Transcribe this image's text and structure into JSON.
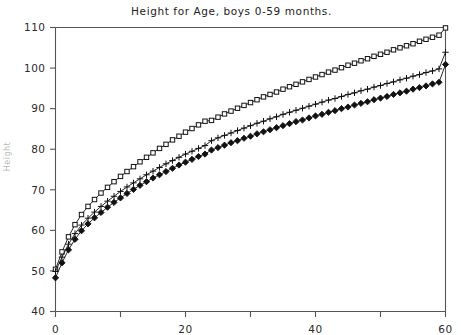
{
  "chart_title": "Height for Age, boys 0-59 months.",
  "y_axis_label": "Height",
  "axes": {
    "x_tick_labels": [
      "0",
      "20",
      "40",
      "60"
    ],
    "x_minor_ticks": [
      10,
      30,
      50
    ],
    "y_tick_labels": [
      "40",
      "50",
      "60",
      "70",
      "80",
      "90",
      "100",
      "110"
    ]
  },
  "colors": {
    "line": "#111111",
    "frame": "#555555",
    "text": "#232323"
  },
  "chart_data": {
    "type": "line",
    "title": "Height for Age, boys 0-59 months.",
    "xlabel": "",
    "ylabel": "Height",
    "xlim": [
      0,
      60
    ],
    "ylim": [
      40,
      110
    ],
    "grid": false,
    "legend": "none",
    "x": [
      0,
      1,
      2,
      3,
      4,
      5,
      6,
      7,
      8,
      9,
      10,
      11,
      12,
      13,
      14,
      15,
      16,
      17,
      18,
      19,
      20,
      21,
      22,
      23,
      24,
      25,
      26,
      27,
      28,
      29,
      30,
      31,
      32,
      33,
      34,
      35,
      36,
      37,
      38,
      39,
      40,
      41,
      42,
      43,
      44,
      45,
      46,
      47,
      48,
      49,
      50,
      51,
      52,
      53,
      54,
      55,
      56,
      57,
      58,
      59,
      60
    ],
    "series": [
      {
        "name": "upper",
        "marker": "square",
        "values": [
          50.4,
          54.7,
          58.4,
          61.4,
          63.9,
          65.9,
          67.6,
          69.2,
          70.6,
          72.0,
          73.3,
          74.5,
          75.7,
          76.9,
          78.0,
          79.1,
          80.2,
          81.2,
          82.3,
          83.2,
          84.2,
          85.1,
          86.0,
          86.9,
          87.1,
          87.9,
          88.7,
          89.4,
          90.1,
          90.8,
          91.5,
          92.2,
          92.9,
          93.5,
          94.1,
          94.8,
          95.4,
          96.0,
          96.6,
          97.2,
          97.8,
          98.4,
          99.0,
          99.5,
          100.1,
          100.7,
          101.2,
          101.8,
          102.3,
          102.9,
          103.4,
          103.9,
          104.5,
          105.0,
          105.5,
          106.0,
          106.6,
          107.1,
          107.6,
          108.1,
          109.9
        ]
      },
      {
        "name": "median",
        "marker": "plus",
        "values": [
          49.9,
          53.4,
          56.6,
          59.2,
          61.3,
          63.0,
          64.5,
          65.9,
          67.2,
          68.4,
          69.6,
          70.7,
          71.7,
          72.7,
          73.7,
          74.6,
          75.5,
          76.4,
          77.2,
          78.0,
          78.8,
          79.5,
          80.2,
          80.9,
          82.1,
          82.8,
          83.4,
          84.0,
          84.6,
          85.2,
          85.8,
          86.4,
          86.9,
          87.5,
          88.0,
          88.6,
          89.1,
          89.6,
          90.1,
          90.6,
          91.1,
          91.6,
          92.1,
          92.5,
          93.0,
          93.5,
          93.9,
          94.4,
          94.8,
          95.3,
          95.7,
          96.2,
          96.6,
          97.1,
          97.5,
          98.0,
          98.4,
          98.9,
          99.3,
          99.8,
          103.9
        ]
      },
      {
        "name": "lower",
        "marker": "diamond",
        "values": [
          48.3,
          52.0,
          55.2,
          57.8,
          59.9,
          61.6,
          63.1,
          64.4,
          65.7,
          66.9,
          68.0,
          69.1,
          70.1,
          71.1,
          72.0,
          72.9,
          73.7,
          74.5,
          75.3,
          76.1,
          76.8,
          77.5,
          78.2,
          78.8,
          79.8,
          80.4,
          81.0,
          81.6,
          82.1,
          82.7,
          83.2,
          83.8,
          84.3,
          84.8,
          85.3,
          85.8,
          86.3,
          86.8,
          87.2,
          87.7,
          88.2,
          88.6,
          89.1,
          89.5,
          90.0,
          90.4,
          90.9,
          91.3,
          91.7,
          92.2,
          92.6,
          93.0,
          93.5,
          93.9,
          94.3,
          94.8,
          95.2,
          95.6,
          96.1,
          96.5,
          100.9
        ]
      }
    ]
  }
}
